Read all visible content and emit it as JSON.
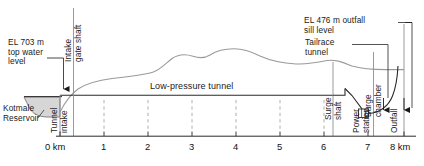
{
  "diagram": {
    "title_text": "Kotmale hydropower tunnel longitudinal profile",
    "labels": {
      "top_water_level": "EL 703 m\ntop water\nlevel",
      "intake_gate_shaft": "Intake\ngate shaft",
      "kotmale_reservoir": "Kotmale\nReservoir",
      "tunnel_intake": "Tunnel\nintake",
      "low_pressure_tunnel": "Low-pressure tunnel",
      "surge_shaft": "Surge\nshaft",
      "surge_chamber": "Surge\nchamber",
      "tailrace_tunnel": "Tailrace\ntunnel",
      "outfall_sill_level": "EL 476 m outfall\nsill level",
      "power_station": "Power\nstation",
      "outfall": "Outfall"
    },
    "elevations": {
      "top_water_level_m": 703,
      "outfall_sill_level_m": 476
    },
    "axis": {
      "unit": "km",
      "ticks": [
        {
          "value": 0,
          "label": "0 km",
          "x": 60
        },
        {
          "value": 1,
          "label": "1",
          "x": 104
        },
        {
          "value": 2,
          "label": "2",
          "x": 148
        },
        {
          "value": 3,
          "label": "3",
          "x": 192
        },
        {
          "value": 4,
          "label": "4",
          "x": 236
        },
        {
          "value": 5,
          "label": "5",
          "x": 280
        },
        {
          "value": 6,
          "label": "6",
          "x": 324
        },
        {
          "value": 7,
          "label": "7",
          "x": 368
        },
        {
          "value": 8,
          "label": "8 km",
          "x": 404
        }
      ]
    },
    "colors": {
      "line": "#4a4a4a",
      "text": "#1a1a1a",
      "reservoir_fill": "#d4d4d4",
      "ground_profile": "#8c8c8c",
      "background": "#ffffff"
    },
    "geometry": {
      "tunnel_y": 95,
      "ground_profile_points": "60,108 66,100 74,92 84,86 96,82 110,79 124,77 140,75 154,72 165,64 174,58 183,55 192,56 200,58 208,57 216,52 226,49 237,49 248,52 258,56 268,59 280,62 292,64 305,64 316,62 326,60 336,62 346,65 356,67 366,68 380,69 392,69 404,69",
      "reservoir_outline": "24,97 30,110 44,116 60,116 60,97",
      "baseline_y": 136
    }
  }
}
